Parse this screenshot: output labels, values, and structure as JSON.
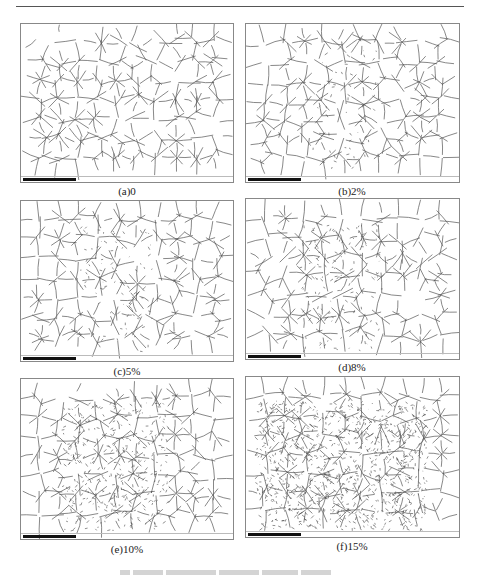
{
  "page": {
    "header_rule": true
  },
  "figure": {
    "panels": [
      {
        "id": "a",
        "label": "(a)0",
        "strain": "0",
        "damage": 0
      },
      {
        "id": "b",
        "label": "(b)2%",
        "strain": "2%",
        "damage": 0.05
      },
      {
        "id": "c",
        "label": "(c)5%",
        "strain": "5%",
        "damage": 0.1
      },
      {
        "id": "d",
        "label": "(d)8%",
        "strain": "8%",
        "damage": 0.15
      },
      {
        "id": "e",
        "label": "(e)10%",
        "strain": "10%",
        "damage": 0.4
      },
      {
        "id": "f",
        "label": "(f)15%",
        "strain": "15%",
        "damage": 1.0
      }
    ],
    "image_type": "EBSD grain boundary map",
    "colors": {
      "grain_boundary": "#555555",
      "scale_bar": "#111111",
      "frame": "#888888"
    }
  }
}
